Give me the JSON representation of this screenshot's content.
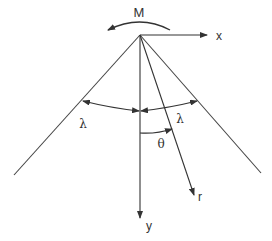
{
  "diagram": {
    "type": "wedge-with-moment",
    "labels": {
      "moment": "M",
      "x_axis": "x",
      "y_axis": "y",
      "radial": "r",
      "half_angle_left": "λ",
      "half_angle_right": "λ",
      "polar_angle": "θ"
    },
    "colors": {
      "line": "#333333",
      "background": "#ffffff"
    },
    "geometry": {
      "apex": [
        140,
        35
      ],
      "left_edge_end": [
        14,
        175
      ],
      "right_edge_end": [
        261,
        173
      ],
      "x_axis_end": [
        207,
        36
      ],
      "y_axis_end": [
        140,
        218
      ],
      "r_end": [
        194,
        195
      ]
    }
  }
}
